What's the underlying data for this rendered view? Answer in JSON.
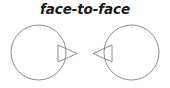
{
  "figure": {
    "title": "face-to-face",
    "background_color": "#ffffff",
    "stroke_color": "#707070",
    "title_color": "#1a1a1a",
    "stroke_width": 0.8,
    "shapes": [
      {
        "name": "left-agent",
        "circle": {
          "cx": 38.5,
          "cy": 52.5,
          "r": 27.5
        },
        "pointer": {
          "direction": "right",
          "points": "58,45 77,53.5 58,62"
        }
      },
      {
        "name": "right-agent",
        "circle": {
          "cx": 131.5,
          "cy": 52.5,
          "r": 27.5
        },
        "pointer": {
          "direction": "left",
          "points": "112,45 93,53.5 112,62"
        }
      }
    ]
  },
  "chart_data": {
    "type": "diagram",
    "title": "face-to-face",
    "elements": [
      {
        "label": "left-agent",
        "shape": "circle-with-right-pointing-triangle",
        "center_x": 38.5,
        "center_y": 52.5,
        "radius": 27.5,
        "pointer_tip_x": 77,
        "pointer_tip_y": 53.5
      },
      {
        "label": "right-agent",
        "shape": "circle-with-left-pointing-triangle",
        "center_x": 131.5,
        "center_y": 52.5,
        "radius": 27.5,
        "pointer_tip_x": 93,
        "pointer_tip_y": 53.5
      }
    ],
    "gap_between_pointer_tips": 16,
    "xlim": [
      0,
      170
    ],
    "ylim": [
      0,
      88
    ],
    "grid": false,
    "legend": "none"
  }
}
